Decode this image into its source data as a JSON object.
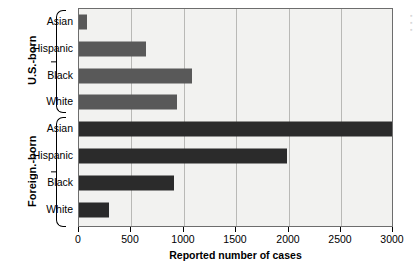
{
  "chart_data": {
    "type": "bar",
    "orientation": "horizontal",
    "title": "",
    "xlabel": "Reported number of cases",
    "ylabel": "",
    "xlim": [
      0,
      3000
    ],
    "xticks": [
      0,
      500,
      1000,
      1500,
      2000,
      2500,
      3000
    ],
    "grid": true,
    "legend": "none",
    "categories": [
      "Asian",
      "Hispanic",
      "Black",
      "White",
      "Asian",
      "Hispanic",
      "Black",
      "White"
    ],
    "groups": [
      {
        "name": "U.S.-born",
        "color": "#595959",
        "categories": [
          "Asian",
          "Hispanic",
          "Black",
          "White"
        ],
        "values": [
          80,
          640,
          1085,
          940
        ]
      },
      {
        "name": "Foreign.-born",
        "color": "#2b2b2b",
        "categories": [
          "Asian",
          "Hispanic",
          "Black",
          "White"
        ],
        "values": [
          3000,
          1990,
          915,
          285
        ]
      }
    ],
    "series": [
      {
        "name": "Reported number of cases",
        "values": [
          80,
          640,
          1085,
          940,
          3000,
          1990,
          915,
          285
        ]
      }
    ]
  },
  "axis": {
    "xlabel": "Reported number of cases",
    "ticks": [
      {
        "value": 0,
        "label": "0"
      },
      {
        "value": 500,
        "label": "500"
      },
      {
        "value": 1000,
        "label": "1000"
      },
      {
        "value": 1500,
        "label": "1500"
      },
      {
        "value": 2000,
        "label": "2000"
      },
      {
        "value": 2500,
        "label": "2500"
      },
      {
        "value": 3000,
        "label": "3000"
      }
    ]
  },
  "groups": [
    {
      "label": "U.S.-born"
    },
    {
      "label": "Foreign.-born"
    }
  ],
  "bars": [
    {
      "label": "Asian",
      "value": 80,
      "group": "U.S.-born"
    },
    {
      "label": "Hispanic",
      "value": 640,
      "group": "U.S.-born"
    },
    {
      "label": "Black",
      "value": 1085,
      "group": "U.S.-born"
    },
    {
      "label": "White",
      "value": 940,
      "group": "U.S.-born"
    },
    {
      "label": "Asian",
      "value": 3000,
      "group": "Foreign.-born"
    },
    {
      "label": "Hispanic",
      "value": 1990,
      "group": "Foreign.-born"
    },
    {
      "label": "Black",
      "value": 915,
      "group": "Foreign.-born"
    },
    {
      "label": "White",
      "value": 285,
      "group": "Foreign.-born"
    }
  ],
  "colors": {
    "us_born_bar": "#595959",
    "foreign_born_bar": "#2b2b2b",
    "plot_background": "#f2f2f0",
    "gridline": "#b9b9b6",
    "axis": "#6d6d6d"
  }
}
